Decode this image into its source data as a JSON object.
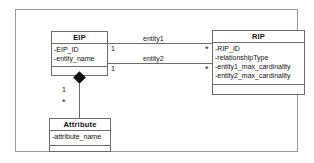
{
  "diagram": {
    "type": "uml-class-diagram",
    "classes": [
      {
        "id": "EIP",
        "name": "EIP",
        "attributes": [
          "-EIP_ID",
          "-entity_name"
        ],
        "operations": []
      },
      {
        "id": "RIP",
        "name": "RIP",
        "attributes": [
          "-RIP_ID",
          "-relationshipType",
          "-entity1_max_cardinality",
          "-entity2_max_cardinality"
        ],
        "operations": []
      },
      {
        "id": "Attribute",
        "name": "Attribute",
        "attributes": [
          "-attribute_name"
        ],
        "operations": []
      }
    ],
    "associations": [
      {
        "id": "entity1",
        "label": "entity1",
        "from": "EIP",
        "to": "RIP",
        "from_multiplicity": "1",
        "to_multiplicity": "*"
      },
      {
        "id": "entity2",
        "label": "entity2",
        "from": "EIP",
        "to": "RIP",
        "from_multiplicity": "1",
        "to_multiplicity": "*"
      },
      {
        "id": "eip-attribute-composition",
        "label": "",
        "kind": "composition",
        "from": "EIP",
        "to": "Attribute",
        "from_multiplicity": "1",
        "to_multiplicity": "*"
      }
    ],
    "colors": {
      "frame_border": "#9a9a9a",
      "class_border": "#6d6d6d",
      "text": "#111111",
      "diamond_fill": "#111111",
      "background": "#ffffff"
    }
  }
}
